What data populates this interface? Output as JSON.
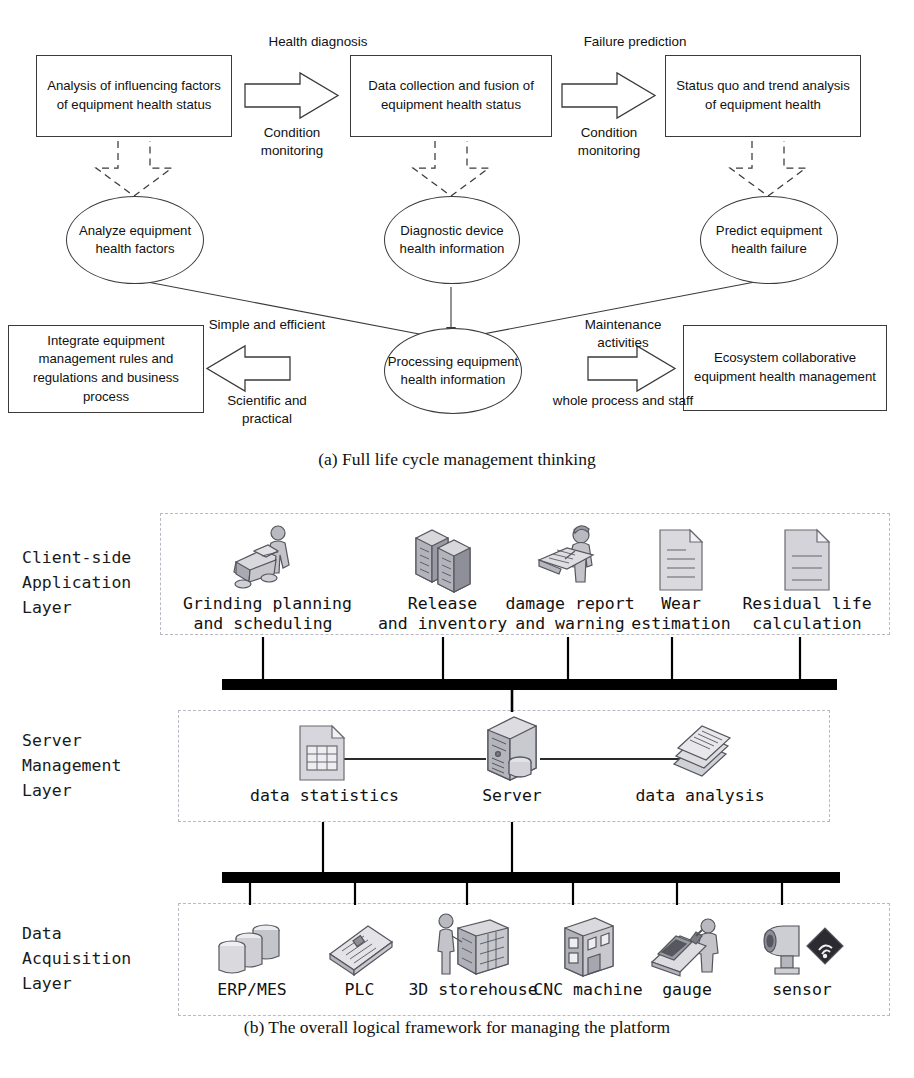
{
  "figure": {
    "panel_a_caption": "(a) Full life cycle management thinking",
    "panel_b_caption": "(b) The overall logical framework for managing the platform"
  },
  "diagram_a": {
    "boxes": [
      {
        "id": "analysis-influencing-factors",
        "text": "Analysis of influencing factors of equipment health status"
      },
      {
        "id": "data-collection-fusion",
        "text": "Data collection and fusion of equipment health status"
      },
      {
        "id": "status-quo-trend",
        "text": "Status quo and trend analysis of equipment health"
      },
      {
        "id": "integrate-management-rules",
        "text": "Integrate equipment management rules and regulations and business process"
      },
      {
        "id": "ecosystem-collaborative",
        "text": "Ecosystem collaborative equipment health management"
      }
    ],
    "ellipses": [
      {
        "id": "analyze-health-factors",
        "text": "Analyze equipment health factors"
      },
      {
        "id": "diagnostic-device-info",
        "text": "Diagnostic device health information"
      },
      {
        "id": "predict-health-failure",
        "text": "Predict equipment health failure"
      },
      {
        "id": "processing-health-info",
        "text": "Processing equipment health information"
      }
    ],
    "arrow_labels": {
      "a1_top": "Health diagnosis",
      "a1_bottom": "Condition monitoring",
      "a2_top": "Failure prediction",
      "a2_bottom": "Condition monitoring",
      "a3_top": "Simple and efficient",
      "a3_bottom": "Scientific and practical",
      "a4_top": "Maintenance activities",
      "a4_bottom": "whole process and staff"
    }
  },
  "diagram_b": {
    "layers": [
      {
        "id": "client-side-application-layer",
        "label": "Client-side\nApplication\nLayer"
      },
      {
        "id": "server-management-layer",
        "label": "Server\nManagement\nLayer"
      },
      {
        "id": "data-acquisition-layer",
        "label": "Data\nAcquisition\nLayer"
      }
    ],
    "client_nodes": [
      {
        "id": "grinding-planning",
        "icon": "worker-grinding-machine-icon",
        "label": "Grinding planning\nand scheduling"
      },
      {
        "id": "release-inventory",
        "icon": "server-stack-icon",
        "label": "Release\nand inventory"
      },
      {
        "id": "damage-report",
        "icon": "person-reading-report-icon",
        "label": "damage report\nand warning"
      },
      {
        "id": "wear-estimation",
        "icon": "document-icon",
        "label": "Wear\nestimation"
      },
      {
        "id": "residual-life",
        "icon": "document-icon",
        "label": "Residual life\ncalculation"
      }
    ],
    "server_nodes": [
      {
        "id": "data-statistics",
        "icon": "spreadsheet-document-icon",
        "label": "data statistics"
      },
      {
        "id": "server",
        "icon": "server-tower-icon",
        "label": "Server"
      },
      {
        "id": "data-analysis",
        "icon": "stacked-papers-icon",
        "label": "data analysis"
      }
    ],
    "acquisition_nodes": [
      {
        "id": "erp-mes",
        "icon": "database-cylinders-icon",
        "label": "ERP/MES"
      },
      {
        "id": "plc",
        "icon": "plc-board-icon",
        "label": "PLC"
      },
      {
        "id": "3d-storehouse",
        "icon": "worker-warehouse-icon",
        "label": "3D storehouse"
      },
      {
        "id": "cnc-machine",
        "icon": "cnc-machine-icon",
        "label": "CNC machine"
      },
      {
        "id": "gauge",
        "icon": "inspector-gauge-icon",
        "label": "gauge"
      },
      {
        "id": "sensor",
        "icon": "camera-sensor-icon",
        "label": "sensor"
      }
    ]
  },
  "colors": {
    "line": "#3a3a3a",
    "bus": "#000000",
    "panel_border": "#b9b9c4",
    "icon_light": "#e6e6ea",
    "icon_mid": "#b9b9c0",
    "icon_dark": "#8d8d96",
    "icon_outline": "#55555d"
  }
}
